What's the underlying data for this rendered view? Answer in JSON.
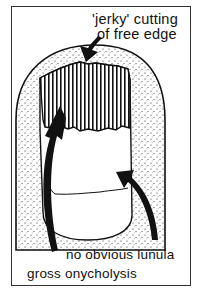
{
  "diagram": {
    "type": "medical-illustration",
    "labels": {
      "top_line1": "'jerky' cutting",
      "top_line2": "of free edge",
      "lunula": "no obvious lunula",
      "onycholysis": "gross onycholysis"
    },
    "colors": {
      "ink": "#111111",
      "background": "#ffffff",
      "border": "#333333"
    }
  }
}
